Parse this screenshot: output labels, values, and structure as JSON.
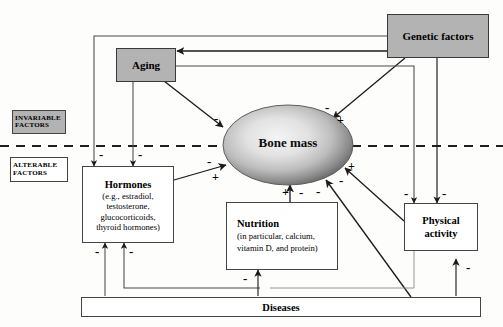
{
  "diagram": {
    "legend": [
      {
        "id": "invariable",
        "line1": "INVARIABLE",
        "line2": "FACTORS",
        "fill": "#b3b3b3"
      },
      {
        "id": "alterable",
        "line1": "ALTERABLE",
        "line2": "FACTORS",
        "fill": "#ffffff"
      }
    ],
    "divider": {
      "label": "",
      "style": "dashed"
    },
    "nodes": [
      {
        "id": "genetic-factors",
        "label": "Genetic factors",
        "detail": "",
        "fill": "#b3b3b3"
      },
      {
        "id": "aging",
        "label": "Aging",
        "detail": "",
        "fill": "#b3b3b3"
      },
      {
        "id": "bone-mass",
        "label": "Bone mass",
        "detail": "",
        "fill": "gradient"
      },
      {
        "id": "hormones",
        "label": "Hormones",
        "detail": "(e.g., estradiol,\ntestosterone,\nglucocorticoids,\nthyroid hormones)",
        "fill": "#ffffff"
      },
      {
        "id": "nutrition",
        "label": "Nutrition",
        "detail": "(in particular, calcium,\nvitamin D, and protein)",
        "fill": "#ffffff"
      },
      {
        "id": "physical-activity",
        "label": "Physical\nactivity",
        "detail": "",
        "fill": "#ffffff"
      },
      {
        "id": "diseases",
        "label": "Diseases",
        "detail": "",
        "fill": "#ffffff"
      }
    ],
    "node_text": {
      "genetic_factors": "Genetic factors",
      "aging": "Aging",
      "bone_mass": "Bone mass",
      "hormones_title": "Hormones",
      "hormones_l1": "(e.g., estradiol,",
      "hormones_l2": "testosterone,",
      "hormones_l3": "glucocorticoids,",
      "hormones_l4": "thyroid hormones)",
      "nutrition_title": "Nutrition",
      "nutrition_l1": "(in particular, calcium,",
      "nutrition_l2": "vitamin D, and protein)",
      "physical_l1": "Physical",
      "physical_l2": "activity",
      "diseases": "Diseases"
    },
    "edges": [
      {
        "id": "genetic-to-aging",
        "from": "genetic-factors",
        "to": "aging",
        "sign": ""
      },
      {
        "id": "genetic-to-bone-mass",
        "from": "genetic-factors",
        "to": "bone-mass",
        "sign": "+"
      },
      {
        "id": "genetic-to-hormones",
        "from": "genetic-factors",
        "to": "hormones",
        "sign": "-"
      },
      {
        "id": "genetic-to-physical-activity",
        "from": "genetic-factors",
        "to": "physical-activity",
        "sign": "-"
      },
      {
        "id": "aging-to-bone-mass",
        "from": "aging",
        "to": "bone-mass",
        "sign": "-"
      },
      {
        "id": "aging-to-hormones",
        "from": "aging",
        "to": "hormones",
        "sign": "-"
      },
      {
        "id": "aging-to-physical-activity",
        "from": "aging",
        "to": "physical-activity",
        "sign": "-"
      },
      {
        "id": "hormones-to-bone-mass",
        "from": "hormones",
        "to": "bone-mass",
        "sign": "+"
      },
      {
        "id": "nutrition-to-bone-mass",
        "from": "nutrition",
        "to": "bone-mass",
        "sign": "+"
      },
      {
        "id": "physical-activity-to-bone-mass",
        "from": "physical-activity",
        "to": "bone-mass",
        "sign": "+"
      },
      {
        "id": "diseases-to-bone-mass",
        "from": "diseases",
        "to": "bone-mass",
        "sign": "-"
      },
      {
        "id": "diseases-to-hormones",
        "from": "diseases",
        "to": "hormones",
        "sign": "-"
      },
      {
        "id": "diseases-to-nutrition",
        "from": "diseases",
        "to": "nutrition",
        "sign": "-"
      },
      {
        "id": "diseases-to-physical-activity",
        "from": "diseases",
        "to": "physical-activity",
        "sign": "-"
      }
    ],
    "signs": [
      {
        "id": "sign-aging-bone-minus",
        "text": "-",
        "x": 214,
        "y": 112
      },
      {
        "id": "sign-genetic-bone-minus",
        "text": "-",
        "x": 325,
        "y": 101
      },
      {
        "id": "sign-genetic-bone-plus",
        "text": "+",
        "x": 337,
        "y": 114
      },
      {
        "id": "sign-genetic-hormones-minus",
        "text": "-",
        "x": 99,
        "y": 148
      },
      {
        "id": "sign-aging-hormones-minus",
        "text": "-",
        "x": 138,
        "y": 148
      },
      {
        "id": "sign-hormones-bone-minus",
        "text": "-",
        "x": 207,
        "y": 155
      },
      {
        "id": "sign-hormones-bone-plus",
        "text": "+",
        "x": 212,
        "y": 171
      },
      {
        "id": "sign-physical-bone-plus",
        "text": "+",
        "x": 348,
        "y": 160
      },
      {
        "id": "sign-physical-bone-minus",
        "text": "-",
        "x": 339,
        "y": 174
      },
      {
        "id": "sign-diseases-bone-minus",
        "text": "-",
        "x": 316,
        "y": 185
      },
      {
        "id": "sign-nutrition-bone-plus",
        "text": "+",
        "x": 282,
        "y": 186
      },
      {
        "id": "sign-nutrition-bone-minus",
        "text": "-",
        "x": 299,
        "y": 186
      },
      {
        "id": "sign-aging-physical-minus",
        "text": "-",
        "x": 404,
        "y": 187
      },
      {
        "id": "sign-genetic-physical-minus",
        "text": "-",
        "x": 442,
        "y": 187
      },
      {
        "id": "sign-diseases-hormones-minus-left",
        "text": "-",
        "x": 95,
        "y": 245
      },
      {
        "id": "sign-diseases-hormones-minus-right",
        "text": "-",
        "x": 129,
        "y": 245
      },
      {
        "id": "sign-diseases-nutrition-minus",
        "text": "-",
        "x": 243,
        "y": 272
      },
      {
        "id": "sign-diseases-physical-minus",
        "text": "-",
        "x": 466,
        "y": 261
      }
    ]
  }
}
